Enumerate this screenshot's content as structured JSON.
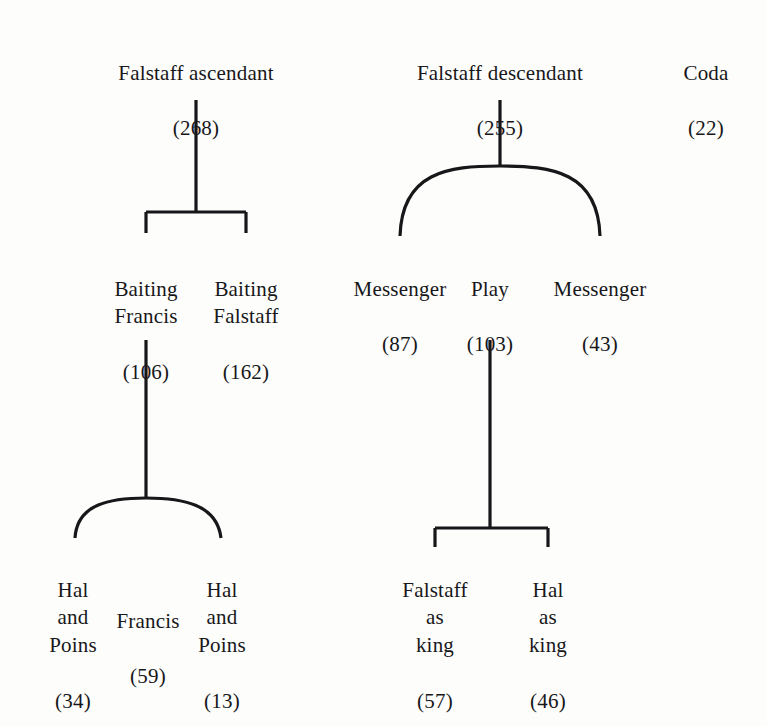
{
  "diagram": {
    "type": "tree",
    "ink_color": "#17171a",
    "background_color": "#fdfdfb",
    "nodes": [
      {
        "id": "falstaff-ascendant",
        "label": "Falstaff ascendant",
        "count": "(268)",
        "level": 0,
        "x": 196,
        "y": 32
      },
      {
        "id": "falstaff-descendant",
        "label": "Falstaff descendant",
        "count": "(255)",
        "level": 0,
        "x": 500,
        "y": 32
      },
      {
        "id": "coda",
        "label": "Coda",
        "count": "(22)",
        "level": 0,
        "x": 706,
        "y": 32
      },
      {
        "id": "baiting-francis",
        "label": "Baiting\nFrancis",
        "count": "(106)",
        "level": 1,
        "x": 146,
        "y": 248
      },
      {
        "id": "baiting-falstaff",
        "label": "Baiting\nFalstaff",
        "count": "(162)",
        "level": 1,
        "x": 246,
        "y": 248
      },
      {
        "id": "messenger-87",
        "label": "Messenger",
        "count": "(87)",
        "level": 1,
        "x": 400,
        "y": 248
      },
      {
        "id": "play",
        "label": "Play",
        "count": "(103)",
        "level": 1,
        "x": 490,
        "y": 248
      },
      {
        "id": "messenger-43",
        "label": "Messenger",
        "count": "(43)",
        "level": 1,
        "x": 600,
        "y": 248
      },
      {
        "id": "hal-and-poins-34",
        "label": "Hal\nand\nPoins",
        "count": "(34)",
        "level": 2,
        "x": 73,
        "y": 549
      },
      {
        "id": "francis-59",
        "label": "Francis",
        "count": "(59)",
        "level": 2,
        "x": 148,
        "y": 580
      },
      {
        "id": "hal-and-poins-13",
        "label": "Hal\nand\nPoins",
        "count": "(13)",
        "level": 2,
        "x": 222,
        "y": 549
      },
      {
        "id": "falstaff-as-king",
        "label": "Falstaff\nas\nking",
        "count": "(57)",
        "level": 2,
        "x": 435,
        "y": 549
      },
      {
        "id": "hal-as-king",
        "label": "Hal\nas\nking",
        "count": "(46)",
        "level": 2,
        "x": 548,
        "y": 549
      }
    ],
    "edges": [
      {
        "id": "edge-ascendant-bracket",
        "style": "bracket",
        "parent": "falstaff-ascendant",
        "children": [
          "baiting-francis",
          "baiting-falstaff"
        ]
      },
      {
        "id": "edge-descendant-arc",
        "style": "arc",
        "parent": "falstaff-descendant",
        "children": [
          "messenger-87",
          "play",
          "messenger-43"
        ]
      },
      {
        "id": "edge-baiting-francis-arc",
        "style": "arc",
        "parent": "baiting-francis",
        "children": [
          "hal-and-poins-34",
          "francis-59",
          "hal-and-poins-13"
        ]
      },
      {
        "id": "edge-play-bracket",
        "style": "bracket",
        "parent": "play",
        "children": [
          "falstaff-as-king",
          "hal-as-king"
        ]
      }
    ]
  }
}
